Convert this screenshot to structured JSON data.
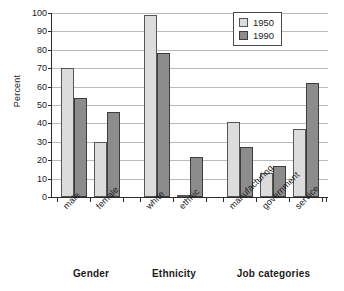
{
  "chart_data": {
    "type": "bar",
    "title": "",
    "xlabel": "",
    "ylabel": "Percent",
    "ylim": [
      0,
      100
    ],
    "yticks": [
      0,
      10,
      20,
      30,
      40,
      50,
      60,
      70,
      80,
      90,
      100
    ],
    "grid": true,
    "legend_position": "top-right",
    "categories": [
      "male",
      "female",
      "white",
      "ethnic",
      "manufacturing",
      "government",
      "service"
    ],
    "groups": [
      {
        "title": "Gender",
        "categories": [
          "male",
          "female"
        ]
      },
      {
        "title": "Ethnicity",
        "categories": [
          "white",
          "ethnic"
        ]
      },
      {
        "title": "Job categories",
        "categories": [
          "manufacturing",
          "government",
          "service"
        ]
      }
    ],
    "series": [
      {
        "name": "1950",
        "color": "#dcdcdc",
        "values": [
          70,
          30,
          99,
          1,
          41,
          13,
          37
        ]
      },
      {
        "name": "1990",
        "color": "#8c8c8c",
        "values": [
          54,
          46,
          78,
          22,
          27,
          17,
          62
        ]
      }
    ]
  },
  "legend": {
    "items": [
      {
        "label": "1950"
      },
      {
        "label": "1990"
      }
    ]
  }
}
